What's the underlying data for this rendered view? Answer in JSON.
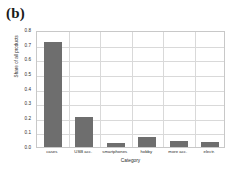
{
  "panel": {
    "label": "(b)"
  },
  "chart_data": {
    "type": "bar",
    "title": "",
    "xlabel": "Category",
    "ylabel": "Share of all products",
    "categories": [
      "cases",
      "USB acc.",
      "smartphones",
      "hobby",
      "more acc.",
      "electr."
    ],
    "values": [
      0.715,
      0.205,
      0.027,
      0.068,
      0.04,
      0.033
    ],
    "ylim": [
      0.0,
      0.8
    ],
    "yticks": [
      "0.8",
      "0.7",
      "0.6",
      "0.5",
      "0.4",
      "0.3",
      "0.2",
      "0.1",
      "0.0"
    ],
    "ytick_values": [
      0.8,
      0.7,
      0.6,
      0.5,
      0.4,
      0.3,
      0.2,
      0.1,
      0.0
    ],
    "grid": true,
    "legend": "none",
    "bar_color": "#6e6e6e",
    "grid_color": "#d9d9d9",
    "frame_color": "#c8c8c8",
    "background": "#ffffff"
  }
}
